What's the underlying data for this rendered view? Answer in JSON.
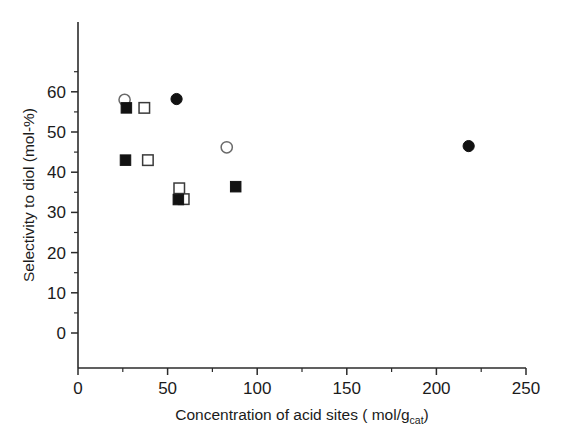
{
  "chart_data": {
    "type": "scatter",
    "title": "",
    "xlabel_parts": {
      "prefix": "Concentration of acid sites (",
      "micro": " ",
      "unit": "mol/g",
      "subscript": "cat",
      "suffix": ")"
    },
    "xlabel": "Concentration of acid sites (  mol/g_cat)",
    "ylabel": "Selectivity to diol (mol-%)",
    "xlim": [
      0,
      250
    ],
    "ylim": [
      0,
      65
    ],
    "x_ticks": [
      0,
      50,
      100,
      150,
      200,
      250
    ],
    "x_ticklabels": [
      "0",
      "50",
      "100",
      "150",
      "200",
      "250"
    ],
    "x_minor_ticks": [
      25,
      75,
      125,
      175,
      225
    ],
    "y_ticks": [
      0,
      10,
      20,
      30,
      40,
      50,
      60
    ],
    "y_ticklabels": [
      "0",
      "10",
      "20",
      "30",
      "40",
      "50",
      "60"
    ],
    "y_minor_ticks": [
      5,
      15,
      25,
      35,
      45,
      55,
      65
    ],
    "grid": false,
    "legend": "none",
    "series": [
      {
        "name": "open-circle",
        "marker": "circle-open",
        "color": "#ffffff",
        "edge_color": "#6a6a6a",
        "points": [
          {
            "x": 26.0,
            "y": 58.0
          },
          {
            "x": 83.0,
            "y": 46.2
          }
        ]
      },
      {
        "name": "filled-circle",
        "marker": "circle-filled",
        "color": "#121212",
        "edge_color": "#121212",
        "points": [
          {
            "x": 55.0,
            "y": 58.2
          },
          {
            "x": 218.0,
            "y": 46.5
          }
        ]
      },
      {
        "name": "filled-square",
        "marker": "square-filled",
        "color": "#121212",
        "edge_color": "#121212",
        "points": [
          {
            "x": 27.0,
            "y": 56.0
          },
          {
            "x": 26.5,
            "y": 43.0
          },
          {
            "x": 56.0,
            "y": 33.2
          },
          {
            "x": 88.0,
            "y": 36.4
          }
        ]
      },
      {
        "name": "open-square",
        "marker": "square-open",
        "color": "#ffffff",
        "edge_color": "#3a3a3a",
        "points": [
          {
            "x": 37.0,
            "y": 56.0
          },
          {
            "x": 39.0,
            "y": 43.0
          },
          {
            "x": 56.5,
            "y": 36.0
          },
          {
            "x": 59.0,
            "y": 33.3
          }
        ]
      }
    ]
  }
}
